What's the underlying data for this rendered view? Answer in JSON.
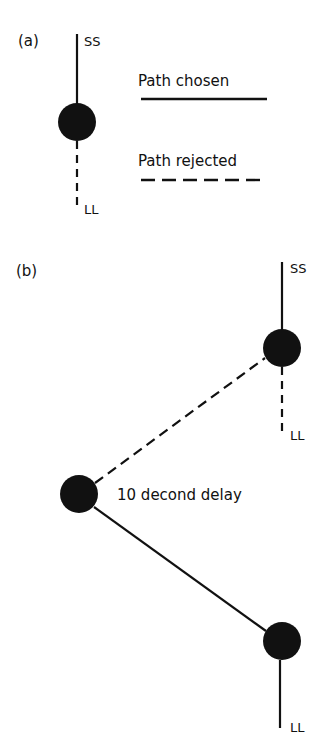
{
  "panel_a": {
    "label": "(a)",
    "node_top_label": "SS",
    "node_bottom_label": "LL",
    "legend": {
      "chosen_label": "Path chosen",
      "rejected_label": "Path rejected"
    }
  },
  "panel_b": {
    "label": "(b)",
    "upper_node_top_label": "SS",
    "upper_node_bottom_label": "LL",
    "left_node_label": "10 decond delay",
    "lower_node_bottom_label": "LL"
  },
  "colors": {
    "ink": "#111111",
    "background": "#ffffff"
  }
}
